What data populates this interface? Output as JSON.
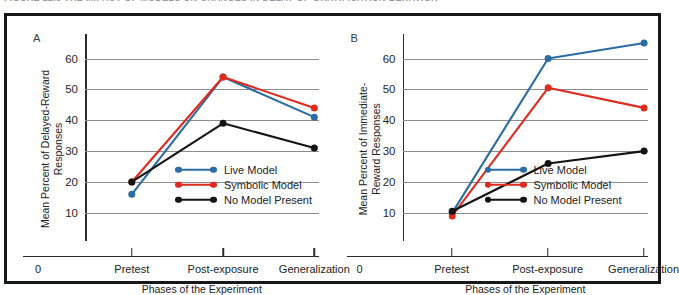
{
  "caption": {
    "text": "FIGURE 12.3   THE IMPACT OF MODELS ON CHANGES IN DELAY-OF-GRATIFICATION BEHAVIOR"
  },
  "colors": {
    "live_model": "#2B6CA3",
    "symbolic_model": "#DE2B20",
    "no_model": "#141414",
    "gridline": "#8D8D8D",
    "axis": "#2A2A2A",
    "frame": "#16181A",
    "background": "#FFFFFF"
  },
  "legend": {
    "items": [
      {
        "label": "Live Model",
        "color_key": "live_model"
      },
      {
        "label": "Symbolic Model",
        "color_key": "symbolic_model"
      },
      {
        "label": "No Model Present",
        "color_key": "no_model"
      }
    ]
  },
  "chart_data": [
    {
      "type": "line",
      "panel": "A",
      "title": "",
      "xlabel": "Phases of the Experiment",
      "ylabel": "Mean Percent of Delayed-Reward Responses",
      "categories": [
        "Pretest",
        "Post-exposure",
        "Generalization"
      ],
      "x_origin_label": "0",
      "yticks": [
        10,
        20,
        30,
        40,
        50,
        60
      ],
      "ylim": [
        8,
        66
      ],
      "grid": true,
      "legend_position": "inside-bottom-right",
      "series": [
        {
          "name": "Live Model",
          "color_key": "live_model",
          "values": [
            16,
            54,
            41
          ]
        },
        {
          "name": "Symbolic Model",
          "color_key": "symbolic_model",
          "values": [
            20,
            54,
            44
          ]
        },
        {
          "name": "No Model Present",
          "color_key": "no_model",
          "values": [
            20,
            39,
            31
          ]
        }
      ]
    },
    {
      "type": "line",
      "panel": "B",
      "title": "",
      "xlabel": "Phases of the Experiment",
      "ylabel": "Mean Percent of Immediate-Reward Responses",
      "categories": [
        "Pretest",
        "Post-exposure",
        "Generalization"
      ],
      "x_origin_label": "0",
      "yticks": [
        10,
        20,
        30,
        40,
        50,
        60
      ],
      "ylim": [
        8,
        66
      ],
      "grid": true,
      "legend_position": "inside-bottom-right",
      "series": [
        {
          "name": "Live Model",
          "color_key": "live_model",
          "values": [
            10,
            60,
            65
          ]
        },
        {
          "name": "Symbolic Model",
          "color_key": "symbolic_model",
          "values": [
            9,
            50.5,
            44
          ]
        },
        {
          "name": "No Model Present",
          "color_key": "no_model",
          "values": [
            10.5,
            26,
            30
          ]
        }
      ]
    }
  ]
}
